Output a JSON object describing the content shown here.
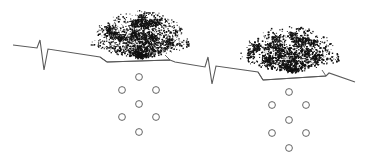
{
  "diagram": {
    "colors": {
      "background": "#ffffff",
      "line": "#5a5a5a",
      "foliage": "#111111",
      "circle_stroke": "#555555"
    },
    "ground_line": {
      "points": [
        [
          13,
          45
        ],
        [
          37,
          48
        ],
        [
          40,
          40
        ],
        [
          44,
          70
        ],
        [
          48,
          49
        ],
        [
          100,
          57
        ],
        [
          107,
          62
        ],
        [
          170,
          60
        ],
        [
          175,
          62
        ],
        [
          205,
          67
        ],
        [
          208,
          57
        ],
        [
          212,
          84
        ],
        [
          216,
          66
        ],
        [
          258,
          72
        ],
        [
          263,
          80
        ],
        [
          326,
          76
        ],
        [
          329,
          73
        ],
        [
          355,
          82
        ]
      ]
    },
    "plants": [
      {
        "label": "shrub-left",
        "center": [
          140,
          35
        ],
        "width": 100,
        "height": 50,
        "trench": [
          [
            100,
            57
          ],
          [
            107,
            62
          ],
          [
            170,
            60
          ],
          [
            165,
            55
          ]
        ],
        "holes": [
          [
            139,
            77
          ],
          [
            122,
            90
          ],
          [
            156,
            90
          ],
          [
            139,
            104
          ],
          [
            122,
            117
          ],
          [
            156,
            117
          ],
          [
            139,
            132
          ]
        ]
      },
      {
        "label": "shrub-right",
        "center": [
          290,
          50
        ],
        "width": 100,
        "height": 48,
        "trench": [
          [
            258,
            72
          ],
          [
            263,
            80
          ],
          [
            326,
            76
          ],
          [
            322,
            70
          ]
        ],
        "holes": [
          [
            289,
            92
          ],
          [
            272,
            105
          ],
          [
            306,
            105
          ],
          [
            289,
            120
          ],
          [
            272,
            133
          ],
          [
            306,
            133
          ],
          [
            289,
            148
          ]
        ]
      }
    ],
    "hole_radius": 3.4
  }
}
